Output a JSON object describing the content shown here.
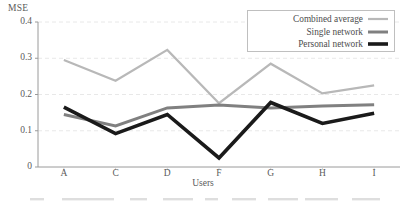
{
  "chart_data": {
    "type": "line",
    "title": "",
    "xlabel": "Users",
    "ylabel": "MSE",
    "categories": [
      "A",
      "C",
      "D",
      "F",
      "G",
      "H",
      "I"
    ],
    "ylim": [
      0,
      0.4
    ],
    "yticks": [
      "0",
      "0.1",
      "0.2",
      "0.3",
      "0.4"
    ],
    "ytick_values": [
      0,
      0.1,
      0.2,
      0.3,
      0.4
    ],
    "grid": true,
    "grid_axis": "y",
    "legend_position": "top-right",
    "series": [
      {
        "name": "Combined average",
        "color": "#b8b8b8",
        "values": [
          0.295,
          0.238,
          0.323,
          0.176,
          0.285,
          0.203,
          0.225
        ]
      },
      {
        "name": "Single network",
        "color": "#808080",
        "values": [
          0.145,
          0.113,
          0.163,
          0.171,
          0.163,
          0.168,
          0.172
        ]
      },
      {
        "name": "Personal network",
        "color": "#1a1a1a",
        "values": [
          0.165,
          0.092,
          0.145,
          0.025,
          0.178,
          0.12,
          0.148
        ]
      }
    ]
  },
  "axes": {
    "y_title": "MSE",
    "x_title": "Users"
  },
  "legend": {
    "items": [
      {
        "label": "Combined average",
        "color": "#b8b8b8",
        "width": 2.2
      },
      {
        "label": "Single network",
        "color": "#808080",
        "width": 3.0
      },
      {
        "label": "Personal network",
        "color": "#1a1a1a",
        "width": 3.6
      }
    ]
  }
}
